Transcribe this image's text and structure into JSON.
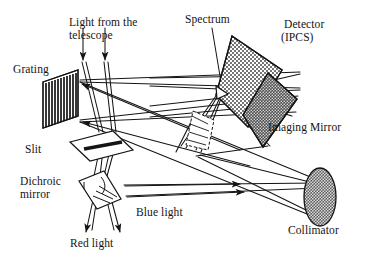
{
  "figure": {
    "background_color": "#ffffff",
    "ink_color": "#141414"
  },
  "labels": {
    "grating": "Grating",
    "light_from_telescope_line1": "Light from the",
    "light_from_telescope_line2": "telescope",
    "spectrum": "Spectrum",
    "detector_line1": "Detector",
    "detector_line2": "(IPCS)",
    "imaging_mirror": "Imaging Mirror",
    "collimator": "Collimator",
    "blue_light": "Blue light",
    "red_light": "Red light",
    "slit": "Slit",
    "dichroic_mirror_line1": "Dichroic",
    "dichroic_mirror_line2": "mirror"
  },
  "components": [
    {
      "name": "grating",
      "label": "Grating",
      "shape": "striped-parallelogram",
      "fill": "#ffffff",
      "stripes": "vertical black rulings",
      "bounds": {
        "x": 43,
        "y": 70,
        "width": 38,
        "height": 60
      }
    },
    {
      "name": "slit",
      "label": "Slit",
      "shape": "outlined-parallelogram-with-bar",
      "fill": "#ffffff",
      "bounds": {
        "x": 68,
        "y": 131,
        "width": 66,
        "height": 31
      }
    },
    {
      "name": "dichroic-mirror",
      "label": "Dichroic mirror",
      "shape": "tilted-quadrilateral",
      "fill": "#ffffff",
      "bounds": {
        "x": 78,
        "y": 170,
        "width": 44,
        "height": 40
      }
    },
    {
      "name": "collimator",
      "label": "Collimator",
      "shape": "ellipse",
      "fill": "#6e6e6e",
      "texture": "dense-dot-stipple",
      "bounds": {
        "x": 304,
        "y": 168,
        "width": 32,
        "height": 58
      }
    },
    {
      "name": "imaging-mirror",
      "label": "Imaging Mirror",
      "shape": "parallelogram",
      "fill": "#5a5a5a",
      "texture": "dark-dot-stipple",
      "bounds": {
        "x": 243,
        "y": 73,
        "width": 54,
        "height": 74
      }
    },
    {
      "name": "detector-ipcs",
      "label": "Detector (IPCS)",
      "shape": "elongated-rectangle",
      "fill": "#efefef",
      "texture": "light-dot-stipple",
      "rotation_deg": -35,
      "bounds": {
        "x": 214,
        "y": 36,
        "width": 68,
        "height": 98
      }
    },
    {
      "name": "spectrum",
      "label": "Spectrum",
      "shape": "small-wedge-at-detector-face",
      "bounds": {
        "x": 215,
        "y": 84,
        "width": 14,
        "height": 14
      }
    },
    {
      "name": "prism-assembly",
      "label": "",
      "shape": "hatched-wedge",
      "fill": "#ffffff",
      "bounds": {
        "x": 185,
        "y": 110,
        "width": 30,
        "height": 40
      }
    }
  ],
  "beams": [
    {
      "name": "telescope-input-left",
      "color": "#141414",
      "arrow": "down"
    },
    {
      "name": "telescope-input-right",
      "color": "#141414",
      "arrow": "down"
    },
    {
      "name": "red-light-output-left",
      "color": "#141414",
      "arrow": "down"
    },
    {
      "name": "red-light-output-right",
      "color": "#141414",
      "arrow": "down"
    },
    {
      "name": "blue-light-to-collimator",
      "color": "#141414",
      "arrow": "left"
    },
    {
      "name": "collimator-to-grating",
      "color": "#141414",
      "arrow": "left"
    },
    {
      "name": "grating-to-imaging-mirror",
      "color": "#141414",
      "arrow": "right"
    },
    {
      "name": "imaging-mirror-to-detector",
      "color": "#141414",
      "arrow": "up"
    }
  ]
}
